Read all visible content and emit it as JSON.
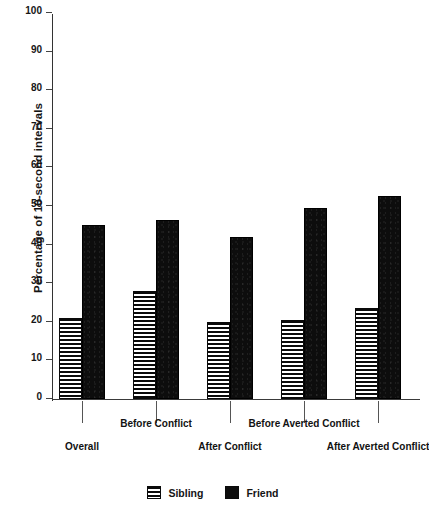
{
  "chart_data": {
    "type": "bar",
    "title": "",
    "xlabel": "",
    "ylabel": "Percentage of 10-second intervals",
    "ylim": [
      0,
      100
    ],
    "ytick_labels": [
      "0",
      "10",
      "20",
      "30",
      "40",
      "50",
      "60",
      "70",
      "80",
      "90",
      "100"
    ],
    "ytick_values": [
      0,
      10,
      20,
      30,
      40,
      50,
      60,
      70,
      80,
      90,
      100
    ],
    "grid": false,
    "legend_position": "bottom-center",
    "categories": [
      "Overall",
      "Before Conflict",
      "After Conflict",
      "Before Averted Conflict",
      "After Averted Conflict"
    ],
    "series": [
      {
        "name": "Sibling",
        "fill": "horizontal-stripes",
        "color": "#0a0a0a",
        "values": [
          21,
          28,
          20,
          20.5,
          23.5
        ]
      },
      {
        "name": "Friend",
        "fill": "solid",
        "color": "#0d0d0d",
        "values": [
          45,
          46.5,
          42,
          49.5,
          52.5
        ]
      }
    ]
  },
  "legend": {
    "items": [
      {
        "label": "Sibling",
        "swatch": "striped-swatch-icon"
      },
      {
        "label": "Friend",
        "swatch": "solid-swatch-icon"
      }
    ]
  }
}
